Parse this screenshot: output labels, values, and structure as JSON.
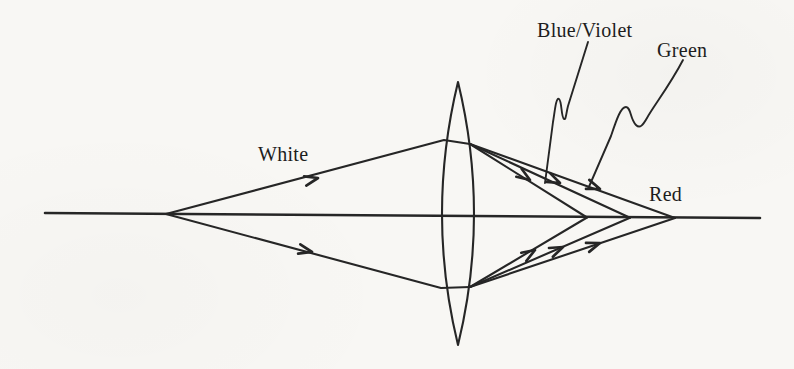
{
  "diagram": {
    "kind": "lens-chromatic-aberration-ray-diagram",
    "labels": {
      "white": "White",
      "blue_violet": "Blue/Violet",
      "green": "Green",
      "red": "Red"
    },
    "colors": {
      "ink": "#262626",
      "paper": "#f8f7f4"
    }
  }
}
